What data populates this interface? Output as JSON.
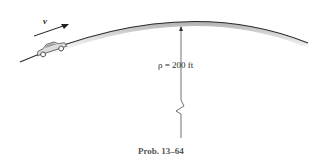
{
  "figure": {
    "velocity_label": "v",
    "radius_label": "ρ = 200 ft",
    "caption": "Prob. 13–64"
  },
  "colors": {
    "road": "#2b2b2b",
    "road_shadow": "#bdbdbd",
    "car_body": "#d9d9d9",
    "line": "#333333",
    "caption": "#555555"
  }
}
